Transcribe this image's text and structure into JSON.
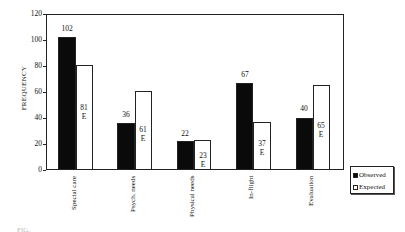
{
  "chart_data": {
    "type": "bar",
    "title": "",
    "xlabel": "",
    "ylabel": "FREQUENCY",
    "ylim": [
      0,
      120
    ],
    "yticks": [
      0,
      20,
      40,
      60,
      80,
      100,
      120
    ],
    "categories": [
      "Special care",
      "Psych. needs",
      "Physical needs",
      "In-flight",
      "Evaluation"
    ],
    "series": [
      {
        "name": "Observed",
        "values": [
          102,
          36,
          22,
          67,
          40
        ],
        "color": "#0a0a0a"
      },
      {
        "name": "Expected",
        "values": [
          81,
          61,
          23,
          37,
          65
        ],
        "color": "#ffffff"
      }
    ],
    "annotations": {
      "expected_marker": "E"
    },
    "grid": false,
    "legend_position": "right-bottom"
  },
  "axis": {
    "ylabel": "FREQUENCY",
    "yticks": [
      "0",
      "20",
      "40",
      "60",
      "80",
      "100",
      "120"
    ]
  },
  "labels": {
    "obs": [
      "102",
      "36",
      "22",
      "67",
      "40"
    ],
    "exp": [
      "81",
      "61",
      "23",
      "37",
      "65"
    ],
    "e": "E",
    "cats": [
      "Special care",
      "Psych. needs",
      "Physical needs",
      "In-flight",
      "Evaluation"
    ]
  },
  "legend": {
    "observed": "Observed",
    "expected": "Expected"
  },
  "caption": "FIG."
}
